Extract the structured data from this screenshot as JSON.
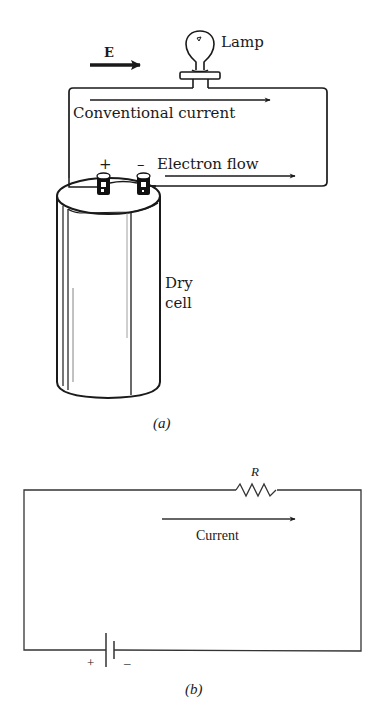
{
  "figure_a": {
    "field_label": "E",
    "lamp_label": "Lamp",
    "conventional_label": "Conventional current",
    "electron_label": "Electron flow",
    "plus_terminal": "+",
    "minus_terminal": "–",
    "cell_label_line1": "Dry",
    "cell_label_line2": "cell",
    "caption": "(a)"
  },
  "figure_b": {
    "resistor_label": "R",
    "current_label": "Current",
    "plus_sign": "+",
    "minus_sign": "–",
    "caption": "(b)"
  },
  "colors": {
    "ink": "#1a1a1a",
    "background": "#ffffff"
  }
}
